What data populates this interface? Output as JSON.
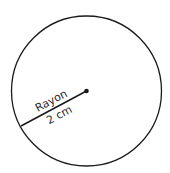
{
  "diagram": {
    "shape": "circle",
    "center": {
      "x": 86.5,
      "y": 91
    },
    "radius_px": 75,
    "radius_line_end": {
      "x": 21,
      "y": 126
    },
    "stroke_color": "#1a1a1a",
    "label_top": "Rayon",
    "label_bottom": "2 cm"
  }
}
